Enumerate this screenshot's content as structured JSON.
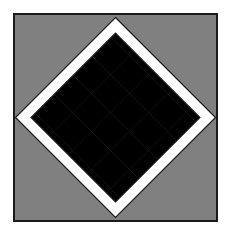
{
  "artwork": {
    "title": "Diamond Cube Tiling",
    "canvas": {
      "width": 228,
      "height": 236
    },
    "page_background": "#ffffff",
    "frame": {
      "x": 13,
      "y": 13,
      "width": 205,
      "height": 209,
      "fill": "#808080",
      "stroke": "#1a1a1a",
      "stroke_width": 2
    },
    "palette": {
      "background_gray": "#808080",
      "face_gray": "#787878",
      "face_gray_dark": "#6e6e6e",
      "face_white": "#ffffff",
      "face_black": "#000000",
      "band_white": "#ffffff",
      "outline": "#1a1a1a"
    },
    "diamond": {
      "center_x": 115.5,
      "center_y": 117.5,
      "half_width": 100,
      "half_height": 100,
      "band_width": 11,
      "description": "white diagonal band inscribed as a rotated square separating the outer gray corners from the inner cube field"
    },
    "tiling": {
      "motif": "isometric-cube",
      "cell_width": 38,
      "cell_height": 38,
      "columns": 5,
      "rows": 5,
      "top_face": "#000000",
      "left_face": "#ffffff",
      "right_face": "#787878",
      "description": "rows of black rhombus tops with white left faces and gray right faces, offset in a staggered diamond lattice"
    },
    "corner_triangles": [
      {
        "name": "top-left-triangle",
        "fill": "#808080"
      },
      {
        "name": "top-right-triangle",
        "fill": "#808080"
      },
      {
        "name": "bottom-left-triangle",
        "fill": "#808080"
      },
      {
        "name": "bottom-right-triangle",
        "fill": "#808080"
      }
    ]
  }
}
